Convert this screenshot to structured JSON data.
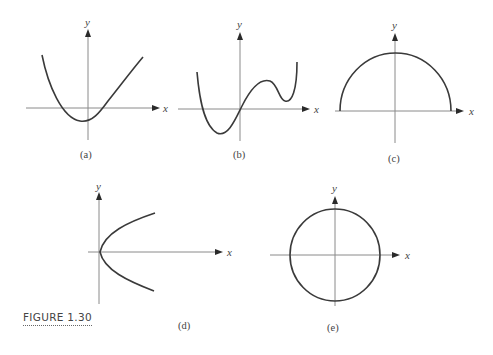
{
  "figure": {
    "caption": "FIGURE 1.30",
    "panels": [
      {
        "id": "a",
        "label": "(a)",
        "x_axis_label": "x",
        "y_axis_label": "y",
        "description": "upward-opening parabola with minimum slightly left of y-axis, below x-axis"
      },
      {
        "id": "b",
        "label": "(b)",
        "x_axis_label": "x",
        "y_axis_label": "y",
        "description": "quartic-like curve through origin with minimum left, local max and local min right"
      },
      {
        "id": "c",
        "label": "(c)",
        "x_axis_label": "x",
        "y_axis_label": "y",
        "description": "upper semicircle on x-axis"
      },
      {
        "id": "d",
        "label": "(d)",
        "x_axis_label": "x",
        "y_axis_label": "y",
        "description": "sideways parabola opening right, vertex at origin"
      },
      {
        "id": "e",
        "label": "(e)",
        "x_axis_label": "x",
        "y_axis_label": "y",
        "description": "circle centered at origin"
      }
    ]
  },
  "colors": {
    "curve": "#3a3a3a",
    "axis": "#8a8a8a",
    "text": "#444444"
  }
}
